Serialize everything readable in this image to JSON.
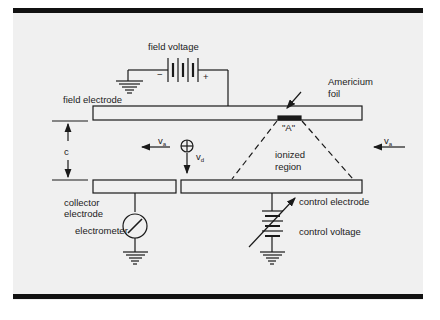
{
  "diagram": {
    "type": "schematic",
    "labels": {
      "field_voltage": "field voltage",
      "field_electrode": "field electrode",
      "americium_foil_line1": "Americium",
      "americium_foil_line2": "foil",
      "source_area": "\"A\"",
      "gap": "c",
      "ionized_region_line1": "ionized",
      "ionized_region_line2": "region",
      "collector_electrode_line1": "collector",
      "collector_electrode_line2": "electrode",
      "electrometer": "electrometer",
      "control_electrode": "control electrode",
      "control_voltage": "control voltage",
      "battery_minus": "−",
      "battery_plus": "+",
      "air_velocity_symbol": "v",
      "air_velocity_sub": "a",
      "drift_velocity_symbol": "v",
      "drift_velocity_sub": "d"
    },
    "colors": {
      "panel": "#f0f0f0",
      "ink": "#1a1a1a",
      "frame_bar": "#111111"
    }
  }
}
